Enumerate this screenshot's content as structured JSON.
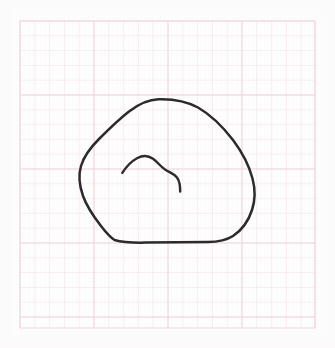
{
  "canvas": {
    "width": 335,
    "height": 348,
    "background_color": "#fdfdfd",
    "caption": ""
  },
  "paper": {
    "name": "graph-paper-sheet",
    "left": 20,
    "top": 21,
    "width": 295,
    "height": 307,
    "fill_color": "#fffefe",
    "border_color": "#f2dfe2",
    "minor_grid_color": "#f8ecee",
    "major_grid_color": "#f0d6db",
    "minor_spacing": 14.8,
    "major_spacing": 74,
    "minor_vertical_x": [
      20,
      34.8,
      49.6,
      64.4,
      79.2,
      94,
      108.8,
      123.6,
      138.4,
      153.2,
      168,
      182.8,
      197.6,
      212.4,
      227.2,
      242,
      256.8,
      271.6,
      286.4,
      301.2,
      315
    ],
    "minor_horizontal_y": [
      21,
      35.8,
      50.6,
      65.4,
      80.2,
      95,
      109.8,
      124.6,
      139.4,
      154.2,
      169,
      183.8,
      198.6,
      213.4,
      228.2,
      243,
      257.8,
      272.6,
      287.4,
      302.2,
      317,
      328
    ],
    "major_vertical_x": [
      20,
      94,
      168,
      242,
      315
    ],
    "major_horizontal_y": [
      21,
      95,
      169,
      243,
      317
    ]
  },
  "drawing": {
    "name": "hand-drawn-blob-sketch",
    "stroke_color": "#2b2a2e",
    "outer_stroke_width": 2.5,
    "inner_stroke_width": 2.4,
    "outer_outline": {
      "name": "outer-blob-outline",
      "path": "M 158.5 99.2 C 147 99.5 138 104.5 129 111.5 C 118 120 108 130 99 139 C 91 147 84 156 81 166 C 78 176 79.5 186 83 196 C 87 207 94 217 101 226 C 106 232.5 110 237 114.5 240 C 123 242.5 133 242.8 145 242.6 C 165 242.3 188 242.4 208 242.1 C 218 241.9 226 240.5 233 236 C 242 230 248.5 221 252 210 C 255.5 199.5 255.3 189 252.5 178.5 C 249 165 242 152 233 140 C 223 127 211 115 198 107.5 C 186 100.8 172 98.8 158.5 99.2 Z",
      "description": "rounded triangular closed blob with flat bottom edge"
    },
    "inner_curve": {
      "name": "inner-hill-curve",
      "path": "M 122.3 172.8 C 126 167 131 161.5 137 158.2 C 142.5 155.2 148.5 155.5 153 158.8 C 157.5 162 160.5 166.5 165 169.5 C 169.5 172.5 174 173.5 177 177.5 C 179.8 181.2 180.2 186 180.2 191.5",
      "description": "open hill-shaped curve with downward hook at right end"
    }
  }
}
